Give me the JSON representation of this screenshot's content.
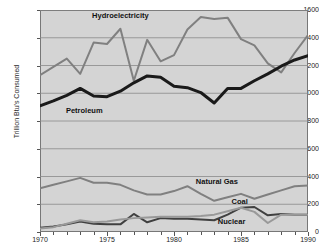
{
  "chart_data": {
    "type": "line",
    "title": "",
    "xlabel": "",
    "ylabel": "Trillion Btu's Consumed",
    "xlim": [
      1970,
      1990
    ],
    "ylim": [
      0,
      1600
    ],
    "ytick_step": 200,
    "yticks": [
      0,
      200,
      400,
      600,
      800,
      1000,
      1200,
      1400,
      1600
    ],
    "xticks_major": [
      1970,
      1975,
      1980,
      1985,
      1990
    ],
    "xticks_minor_step": 1,
    "grid": "horizontal",
    "legend_position": "inline-labels",
    "plot_background": "#d4d4d4",
    "x": [
      1970,
      1971,
      1972,
      1973,
      1974,
      1975,
      1976,
      1977,
      1978,
      1979,
      1980,
      1981,
      1982,
      1983,
      1984,
      1985,
      1986,
      1987,
      1988,
      1989,
      1990
    ],
    "series": [
      {
        "name": "Hydroelectricity",
        "color": "#808080",
        "width": 2,
        "values": [
          1130,
          1190,
          1250,
          1140,
          1365,
          1355,
          1465,
          1090,
          1385,
          1230,
          1275,
          1460,
          1550,
          1535,
          1545,
          1390,
          1345,
          1215,
          1150,
          1290,
          1420
        ]
      },
      {
        "name": "Petroleum",
        "color": "#1a1a1a",
        "width": 3,
        "values": [
          910,
          945,
          985,
          1035,
          980,
          975,
          1015,
          1075,
          1125,
          1115,
          1050,
          1040,
          1005,
          930,
          1035,
          1035,
          1090,
          1140,
          1195,
          1240,
          1270
        ]
      },
      {
        "name": "Natural Gas",
        "color": "#808080",
        "width": 2,
        "values": [
          315,
          340,
          365,
          390,
          355,
          355,
          340,
          300,
          270,
          270,
          295,
          330,
          275,
          225,
          250,
          275,
          240,
          270,
          300,
          330,
          335
        ]
      },
      {
        "name": "Coal",
        "color": "#404040",
        "width": 2,
        "values": [
          30,
          40,
          55,
          75,
          60,
          55,
          55,
          130,
          70,
          100,
          95,
          95,
          90,
          85,
          125,
          175,
          180,
          120,
          130,
          125,
          125
        ]
      },
      {
        "name": "Nuclear",
        "color": "#999999",
        "width": 2,
        "values": [
          25,
          35,
          60,
          85,
          70,
          75,
          90,
          100,
          105,
          110,
          110,
          110,
          115,
          125,
          150,
          175,
          145,
          65,
          125,
          125,
          125
        ]
      }
    ],
    "annotations": [
      {
        "text": "Hydroelectricity",
        "x": 1976,
        "y": 1560
      },
      {
        "text": "Petroleum",
        "x": 1973.3,
        "y": 870
      },
      {
        "text": "Natural Gas",
        "x": 1983.2,
        "y": 360
      },
      {
        "text": "Coal",
        "x": 1984.9,
        "y": 215
      },
      {
        "text": "Nuclear",
        "x": 1984.3,
        "y": 75
      }
    ]
  },
  "axis": {
    "y_title": "Trillion Btu's Consumed",
    "y_labels": [
      "1600",
      "1400",
      "1200",
      "1000",
      "800",
      "600",
      "400",
      "200",
      "0"
    ],
    "x_labels": [
      "1970",
      "1975",
      "1980",
      "1985",
      "1990"
    ]
  },
  "labels": {
    "hydroelectricity": "Hydroelectricity",
    "petroleum": "Petroleum",
    "natural_gas": "Natural Gas",
    "coal": "Coal",
    "nuclear": "Nuclear"
  }
}
